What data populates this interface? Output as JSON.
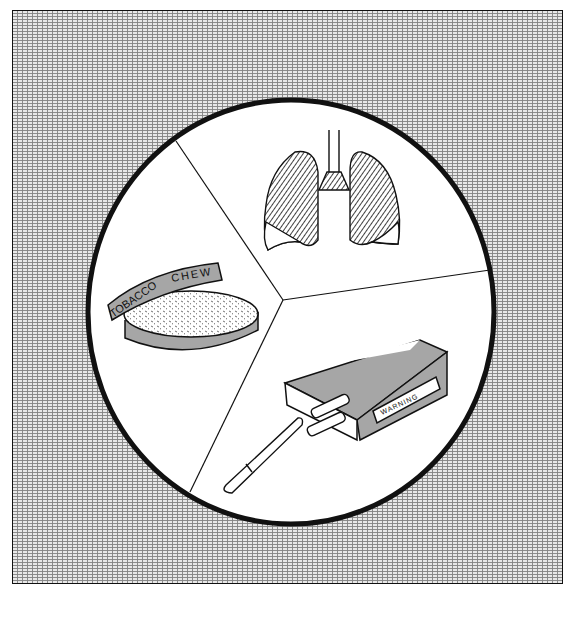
{
  "illustration": {
    "subject": "Tobacco health risks",
    "segments": [
      {
        "id": "lungs",
        "description": "damaged lungs"
      },
      {
        "id": "chew",
        "description": "tobacco chew tin",
        "lid_text_left": "TOBACCO",
        "lid_text_right": "CHEW"
      },
      {
        "id": "cigarettes",
        "description": "cigarette pack with cigarette",
        "label_text": "WARNING"
      }
    ]
  },
  "colors": {
    "background_texture": "#9a9a9a",
    "circle_fill": "#ffffff",
    "outline": "#111111"
  }
}
